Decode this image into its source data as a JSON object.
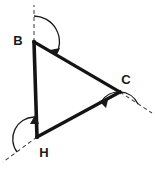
{
  "figure": {
    "kind": "geometry-diagram",
    "shape": "triangle",
    "title_visible": false,
    "background_color": "#ffffff",
    "stroke_color": "#141414",
    "dash_color": "#4a4a4a",
    "label_color": "#1a1a1a"
  },
  "vertices": [
    {
      "id": "B",
      "label": "B",
      "x": 34,
      "y": 42,
      "label_x": 18,
      "label_y": 45
    },
    {
      "id": "C",
      "label": "C",
      "x": 120,
      "y": 92,
      "label_x": 124,
      "label_y": 84
    },
    {
      "id": "H",
      "label": "H",
      "x": 37,
      "y": 137,
      "label_x": 41,
      "label_y": 156
    }
  ],
  "edges": [
    {
      "id": "BC",
      "from": "B",
      "to": "C",
      "label": "",
      "width": 3.2
    },
    {
      "id": "CH",
      "from": "C",
      "to": "H",
      "label": "",
      "width": 3.2
    },
    {
      "id": "HB",
      "from": "H",
      "to": "B",
      "label": "",
      "width": 3.6
    }
  ],
  "exterior_rays": [
    {
      "id": "ray-at-B",
      "at": "B",
      "x1": 34,
      "y1": 42,
      "x2": 34,
      "y2": 5,
      "style": "dashed"
    },
    {
      "id": "ray-at-C",
      "at": "C",
      "x1": 120,
      "y1": 92,
      "x2": 152,
      "y2": 113,
      "style": "dashed"
    },
    {
      "id": "ray-at-H",
      "at": "H",
      "x1": 37,
      "y1": 137,
      "x2": 3,
      "y2": 162,
      "style": "dashed"
    }
  ],
  "angle_arcs": [
    {
      "id": "arc-at-B",
      "at": "B",
      "description": "exterior angle arc at B sweeping from the upward dashed ray clockwise onto side BC",
      "radius": 26,
      "arrow_direction": "clockwise-onto-BC"
    },
    {
      "id": "arc-at-C",
      "at": "C",
      "description": "exterior angle arc at C sweeping from the lower-right dashed ray onto side CH",
      "radius": 22,
      "arrow_direction": "counterclockwise-onto-CH"
    },
    {
      "id": "arc-at-H",
      "at": "H",
      "description": "exterior angle arc at H sweeping from the lower-left dashed ray onto side HB",
      "radius": 22,
      "arrow_direction": "clockwise-onto-HB"
    }
  ]
}
